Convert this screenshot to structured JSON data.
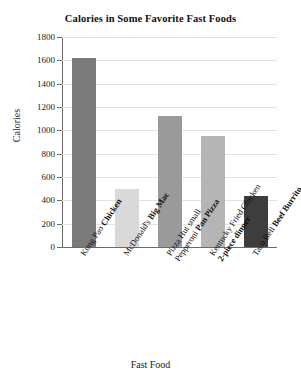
{
  "chart_data": {
    "type": "bar",
    "title": "Calories in Some Favorite Fast Foods",
    "xlabel": "Fast Food",
    "ylabel": "Calories",
    "ylim": [
      0,
      1800
    ],
    "ytick_step": 200,
    "yticks": [
      1800,
      1600,
      1400,
      1200,
      1000,
      800,
      600,
      400,
      200,
      0
    ],
    "ytick_labels": [
      "1800",
      "1600",
      "1400",
      "1200",
      "1000",
      "800",
      "600",
      "400",
      "200",
      "0"
    ],
    "grid": true,
    "legend": "none",
    "categories": [
      "Kung Pao Chicken",
      "McDonald's Big Mac",
      "Pizza Hut small Pepperoni Pan Pizza",
      "Kentucky Fried Chicken 2-piece dinner",
      "Taco Bell Beef Burrito"
    ],
    "values": [
      1620,
      500,
      1120,
      950,
      440
    ],
    "bars": [
      {
        "label_lines": [
          {
            "plain": "Kung Pao ",
            "bold": "Chicken"
          }
        ],
        "value": 1620,
        "color": "#7a7a7a"
      },
      {
        "label_lines": [
          {
            "plain": "McDonald's ",
            "bold": "Big Mac"
          }
        ],
        "value": 500,
        "color": "#d9d9d9"
      },
      {
        "label_lines": [
          {
            "plain": "Pizza Hut small",
            "bold": ""
          },
          {
            "plain": "Pepperoni ",
            "bold": "Pan Pizza"
          }
        ],
        "value": 1120,
        "color": "#9a9a9a"
      },
      {
        "label_lines": [
          {
            "plain": "Kentucky Fried Chicken",
            "bold": ""
          },
          {
            "plain": "",
            "bold": "2-piece dinner"
          }
        ],
        "value": 950,
        "color": "#b5b5b5"
      },
      {
        "label_lines": [
          {
            "plain": "Taco Bell ",
            "bold": "Beef Burrito"
          }
        ],
        "value": 440,
        "color": "#3d3d3d"
      }
    ],
    "axis_color": "#6b6b6b",
    "grid_color": "#e2e2e2"
  }
}
